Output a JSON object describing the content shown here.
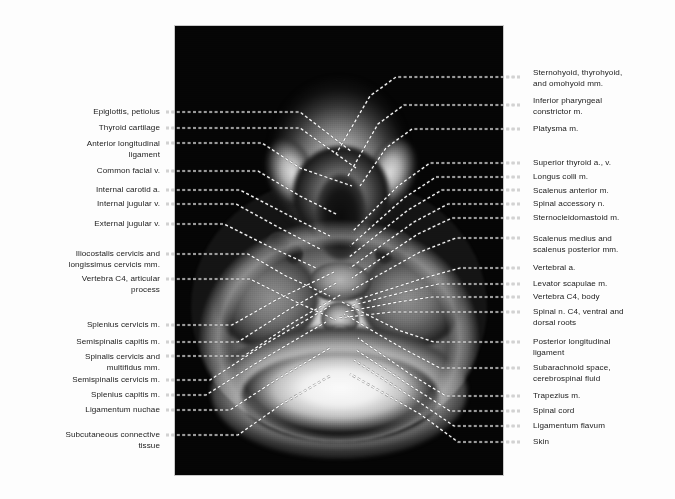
{
  "figure": {
    "type": "axial-mri-neck-c4",
    "panel": {
      "background_color": "#050505",
      "border_color": "#c9c9c9"
    },
    "page_background": "#fdfdfd",
    "leader_line_color": "#ffffff",
    "leader_line_style": "dashed",
    "text_color": "#1b1b1b"
  },
  "labels_left": [
    {
      "text": "Epiglottis, petiolus",
      "y": 107,
      "lead_y": 112,
      "align": "right"
    },
    {
      "text": "Thyroid cartilage",
      "y": 123,
      "lead_y": 128,
      "align": "right"
    },
    {
      "text": "Anterior longitudinal\nligament",
      "y": 139,
      "lead_y": 143,
      "align": "right"
    },
    {
      "text": "Common facial v.",
      "y": 166,
      "lead_y": 171,
      "align": "right"
    },
    {
      "text": "Internal carotid a.",
      "y": 185,
      "lead_y": 190,
      "align": "right"
    },
    {
      "text": "Internal jugular v.",
      "y": 199,
      "lead_y": 204,
      "align": "right"
    },
    {
      "text": "External jugular v.",
      "y": 219,
      "lead_y": 224,
      "align": "right"
    },
    {
      "text": "Iliocostalis cervicis and\nlongissimus cervicis mm.",
      "y": 249,
      "lead_y": 254,
      "align": "right"
    },
    {
      "text": "Vertebra C4, articular\nprocess",
      "y": 274,
      "lead_y": 279,
      "align": "right"
    },
    {
      "text": "Splenius cervicis m.",
      "y": 320,
      "lead_y": 325,
      "align": "right"
    },
    {
      "text": "Semispinalis capitis m.",
      "y": 337,
      "lead_y": 342,
      "align": "right"
    },
    {
      "text": "Spinalis cervicis and\nmultifidus mm.",
      "y": 352,
      "lead_y": 356,
      "align": "right"
    },
    {
      "text": "Semispinalis cervicis m.",
      "y": 375,
      "lead_y": 380,
      "align": "right"
    },
    {
      "text": "Splenius capitis m.",
      "y": 390,
      "lead_y": 395,
      "align": "right"
    },
    {
      "text": "Ligamentum nuchae",
      "y": 405,
      "lead_y": 410,
      "align": "right"
    },
    {
      "text": "Subcutaneous connective\ntissue",
      "y": 430,
      "lead_y": 435,
      "align": "right"
    }
  ],
  "labels_right": [
    {
      "text": "Sternohyoid, thyrohyoid,\nand omohyoid mm.",
      "y": 68,
      "lead_y": 77,
      "align": "left"
    },
    {
      "text": "Inferior pharyngeal\nconstrictor m.",
      "y": 96,
      "lead_y": 105,
      "align": "left"
    },
    {
      "text": "Platysma m.",
      "y": 124,
      "lead_y": 129,
      "align": "left"
    },
    {
      "text": "Superior thyroid a., v.",
      "y": 158,
      "lead_y": 163,
      "align": "left"
    },
    {
      "text": "Longus colli m.",
      "y": 172,
      "lead_y": 177,
      "align": "left"
    },
    {
      "text": "Scalenus anterior m.",
      "y": 186,
      "lead_y": 190,
      "align": "left"
    },
    {
      "text": "Spinal accessory n.",
      "y": 199,
      "lead_y": 204,
      "align": "left"
    },
    {
      "text": "Sternocleidomastoid m.",
      "y": 213,
      "lead_y": 218,
      "align": "left"
    },
    {
      "text": "Scalenus medius and\nscalenus posterior mm.",
      "y": 234,
      "lead_y": 238,
      "align": "left"
    },
    {
      "text": "Vertebral a.",
      "y": 263,
      "lead_y": 268,
      "align": "left"
    },
    {
      "text": "Levator scapulae m.",
      "y": 279,
      "lead_y": 284,
      "align": "left"
    },
    {
      "text": "Vertebra C4, body",
      "y": 292,
      "lead_y": 297,
      "align": "left"
    },
    {
      "text": "Spinal n. C4, ventral and\ndorsal roots",
      "y": 307,
      "lead_y": 312,
      "align": "left"
    },
    {
      "text": "Posterior longitudinal\nligament",
      "y": 337,
      "lead_y": 342,
      "align": "left"
    },
    {
      "text": "Subarachnoid space,\ncerebrospinal fluid",
      "y": 363,
      "lead_y": 368,
      "align": "left"
    },
    {
      "text": "Trapezius m.",
      "y": 391,
      "lead_y": 396,
      "align": "left"
    },
    {
      "text": "Spinal cord",
      "y": 406,
      "lead_y": 411,
      "align": "left"
    },
    {
      "text": "Ligamentum flavum",
      "y": 421,
      "lead_y": 426,
      "align": "left"
    },
    {
      "text": "Skin",
      "y": 437,
      "lead_y": 442,
      "align": "left"
    }
  ],
  "leader_paths_left": [
    "M166,112 L300,112 L352,152",
    "M166,128 L300,128 L356,168",
    "M166,143 L262,143 L300,168 L352,186",
    "M166,171 L258,171 L300,196 L338,215",
    "M166,190 L240,190 L286,214 L330,236",
    "M166,204 L236,204 L276,226 L322,250",
    "M166,224 L224,224 L268,246 L316,268",
    "M166,254 L248,254 L286,276 L330,296",
    "M166,279 L250,279 L292,300 L336,320",
    "M166,325 L232,325 L276,300 L334,272",
    "M166,342 L238,342 L288,310 L338,282",
    "M166,356 L244,356 L294,322 L342,294",
    "M166,380 L210,380 L262,346 L330,306",
    "M166,395 L206,395 L258,362 L326,322",
    "M166,410 L230,410 L276,380 L330,348",
    "M166,435 L238,435 L282,404 L330,376"
  ],
  "leader_paths_right": [
    "M520,77 L396,77 L370,96 L336,154",
    "M520,105 L404,105 L378,124 L348,176",
    "M520,129 L412,129 L386,148 L360,186",
    "M520,163 L430,163 L398,186 L352,232",
    "M520,177 L436,177 L404,198 L350,246",
    "M520,190 L442,190 L408,210 L348,258",
    "M520,204 L448,204 L414,222 L350,268",
    "M520,218 L452,218 L418,234 L352,278",
    "M520,238 L456,238 L420,252 L352,290",
    "M520,268 L460,268 L424,278 L356,300",
    "M520,284 L438,284 L404,292 L350,306",
    "M520,297 L432,297 L398,302 L344,312",
    "M520,312 L428,312 L392,312 L338,318",
    "M520,342 L434,342 L398,330 L342,302",
    "M520,368 L440,368 L402,348 L344,314",
    "M520,396 L446,396 L410,374 L358,338",
    "M520,411 L450,411 L414,388 L356,350",
    "M520,426 L454,426 L416,400 L354,360",
    "M520,442 L458,442 L420,414 L350,374"
  ]
}
